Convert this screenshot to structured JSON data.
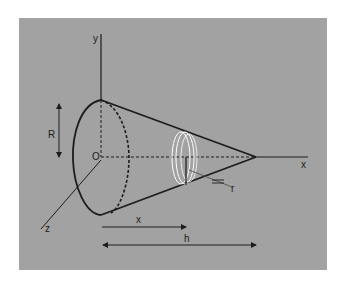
{
  "figure": {
    "colors": {
      "panel_background": "#a2a2a2",
      "page_background": "#ffffff",
      "line": "#1c1c1c",
      "disk": "#ffffff"
    },
    "axes": {
      "x_label": "x",
      "y_label": "y",
      "z_label": "z",
      "origin_label": "O"
    },
    "dimensions": {
      "radius_label": "R",
      "height_label": "h",
      "distance_label": "x",
      "disk_radius_label": "r"
    }
  }
}
